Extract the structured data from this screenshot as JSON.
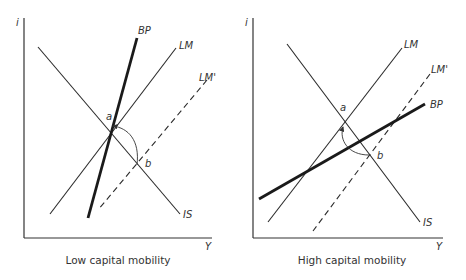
{
  "panels": [
    {
      "caption": "Low capital mobility",
      "axis_y_label": "i",
      "axis_x_label": "Y",
      "curves": {
        "bp": "BP",
        "lm": "LM",
        "lm_prime": "LM'",
        "is": "IS"
      },
      "points": {
        "a": "a",
        "b": "b"
      }
    },
    {
      "caption": "High capital mobility",
      "axis_y_label": "i",
      "axis_x_label": "Y",
      "curves": {
        "bp": "BP",
        "lm": "LM",
        "lm_prime": "LM'",
        "is": "IS"
      },
      "points": {
        "a": "a",
        "b": "b"
      }
    }
  ],
  "colors": {
    "line": "#2a2a2a",
    "axis": "#333333",
    "background": "#ffffff"
  }
}
